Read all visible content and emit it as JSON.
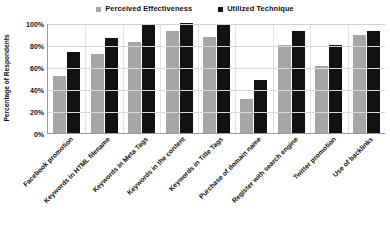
{
  "chart_data": {
    "type": "bar",
    "title": "",
    "xlabel": "",
    "ylabel": "Percentage of Respondents",
    "ylim": [
      0,
      100
    ],
    "yticks": [
      "0%",
      "20%",
      "40%",
      "60%",
      "80%",
      "100%"
    ],
    "grid": true,
    "legend_position": "top-center",
    "categories": [
      "Facebook promotion",
      "Keywords in HTML filename",
      "Keywords in Meta Tags",
      "Keywords in the content",
      "Keywords in Title Tags",
      "Purchase of domain name",
      "Register with search engine",
      "Twitter promotion",
      "Use of backlinks"
    ],
    "series": [
      {
        "name": "Perceived Effectiveness",
        "color": "#a6a6a6",
        "values": [
          52,
          72,
          83,
          93,
          87,
          31,
          80,
          61,
          89
        ]
      },
      {
        "name": "Utilized Technique",
        "color": "#121212",
        "values": [
          74,
          86,
          98,
          100,
          99,
          48,
          93,
          80,
          93
        ]
      }
    ]
  }
}
